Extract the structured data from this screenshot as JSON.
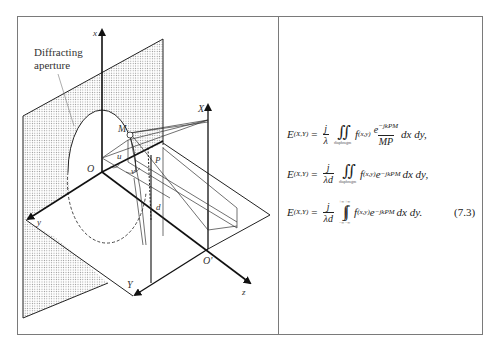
{
  "figure": {
    "caption_label": "Diffracting\naperture",
    "caption_line1": "Diffracting",
    "caption_line2": "aperture",
    "axis_labels": {
      "x": "x",
      "y": "y",
      "z": "z",
      "X": "X",
      "Y": "Y",
      "O": "O",
      "O_prime": "O'",
      "M": "M",
      "P": "P",
      "u": "u",
      "v": "v",
      "d": "d"
    }
  },
  "equations": [
    {
      "lhs": "E",
      "lhs_sub": "(X,Y)",
      "eq": "=",
      "frac_num": "j",
      "frac_den": "λ",
      "integral": "∬",
      "int_lower": "diaphragm",
      "int_upper": "",
      "f": "f",
      "f_sub": "(x,y)",
      "kernel_num": "e",
      "kernel_sup": "−jkPM",
      "kernel_den": "MP",
      "tail": "dx dy,"
    },
    {
      "lhs": "E",
      "lhs_sub": "(X,Y)",
      "eq": "=",
      "frac_num": "j",
      "frac_den": "λd",
      "integral": "∬",
      "int_lower": "diaphragm",
      "int_upper": "",
      "f": "f",
      "f_sub": "(x,y)",
      "kernel": "e",
      "kernel_sup": "−jkPM",
      "tail": "dx dy,"
    },
    {
      "lhs": "E",
      "lhs_sub": "(X,Y)",
      "eq": "=",
      "frac_num": "j",
      "frac_den": "λd",
      "integral": "∫∫",
      "int_lower": "−∞ −∞",
      "int_upper": "+∞ +∞",
      "f": "f",
      "f_sub": "(x,y)",
      "kernel": "e",
      "kernel_sup": "−jkPM",
      "tail": "dx dy."
    }
  ],
  "equation_number": "(7.3)"
}
